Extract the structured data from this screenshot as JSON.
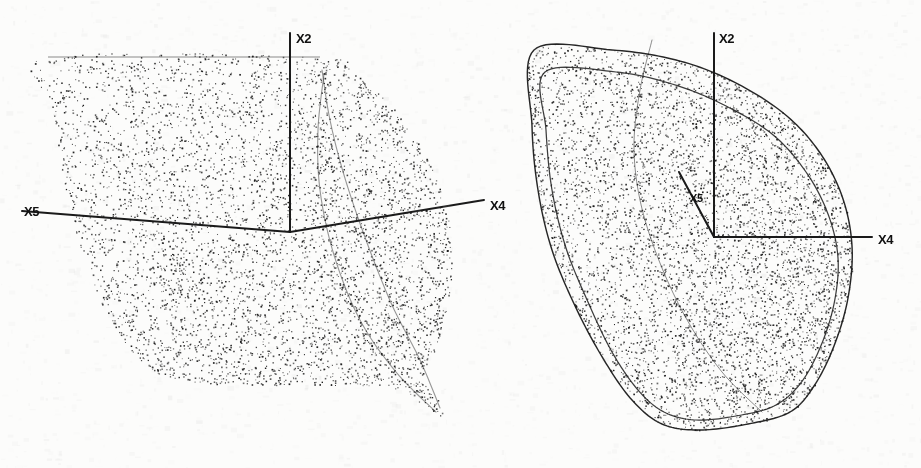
{
  "figure": {
    "kind": "scanned-scientific-figure",
    "background_color": "#fcfcfb",
    "ink_color": "#1a1a1a",
    "panel_count": 2
  },
  "chart_data": {
    "type": "scatter",
    "title": "",
    "subtitle": "",
    "xlabel": "",
    "ylabel": "",
    "grid": false,
    "legend": null,
    "panels": [
      {
        "name": "left-panel",
        "origin": [
          290,
          232
        ],
        "axes": [
          {
            "name": "X2",
            "label": "X2",
            "direction": "up",
            "from": [
              290,
              232
            ],
            "to": [
              290,
              33
            ],
            "label_position": [
              296,
              32
            ]
          },
          {
            "name": "X5",
            "label": "X5",
            "direction": "left",
            "from": [
              290,
              232
            ],
            "to": [
              22,
              211
            ],
            "label_position": [
              24,
              205
            ]
          },
          {
            "name": "X4",
            "label": "X4",
            "direction": "right",
            "from": [
              290,
              232
            ],
            "to": [
              484,
              200
            ],
            "label_position": [
              490,
              199
            ]
          }
        ],
        "cloud": {
          "point_count": 5200,
          "dot_size_px": 1.15,
          "shading": "uniform-stipple-with-dense-fold-ridge",
          "boundary": [
            [
              48,
              57
            ],
            [
              320,
              57
            ],
            [
              352,
              72
            ],
            [
              393,
              108
            ],
            [
              424,
              152
            ],
            [
              444,
              200
            ],
            [
              452,
              252
            ],
            [
              448,
              300
            ],
            [
              437,
              345
            ],
            [
              424,
              378
            ],
            [
              440,
              402
            ],
            [
              442,
              417
            ],
            [
              424,
              405
            ],
            [
              392,
              388
            ],
            [
              330,
              385
            ],
            [
              258,
              385
            ],
            [
              196,
              382
            ],
            [
              152,
              370
            ],
            [
              122,
              340
            ],
            [
              98,
              295
            ],
            [
              78,
              240
            ],
            [
              62,
              170
            ],
            [
              52,
              105
            ]
          ],
          "fold_ridges": [
            [
              [
                322,
                70
              ],
              [
                330,
                120
              ],
              [
                344,
                175
              ],
              [
                366,
                240
              ],
              [
                392,
                305
              ],
              [
                420,
                360
              ],
              [
                440,
                408
              ]
            ],
            [
              [
                324,
                74
              ],
              [
                318,
                130
              ],
              [
                320,
                190
              ],
              [
                334,
                255
              ],
              [
                360,
                320
              ],
              [
                396,
                372
              ],
              [
                436,
                412
              ]
            ]
          ]
        }
      },
      {
        "name": "right-panel",
        "origin": [
          714,
          237
        ],
        "axes": [
          {
            "name": "X2",
            "label": "X2",
            "direction": "up",
            "from": [
              714,
              237
            ],
            "to": [
              714,
              33
            ],
            "label_position": [
              719,
              32
            ]
          },
          {
            "name": "X4",
            "label": "X4",
            "direction": "right",
            "from": [
              714,
              237
            ],
            "to": [
              872,
              237
            ],
            "label_position": [
              878,
              233
            ]
          },
          {
            "name": "X5",
            "label": "X5",
            "direction": "upper-left",
            "from": [
              714,
              237
            ],
            "to": [
              679,
              172
            ],
            "label_position": [
              690,
              193
            ]
          }
        ],
        "cloud": {
          "point_count": 5600,
          "dot_size_px": 1.15,
          "shading": "uniform-stipple-dense-toward-right-edge",
          "outer_boundary": [
            [
              534,
              50
            ],
            [
              612,
              50
            ],
            [
              676,
              60
            ],
            [
              730,
              80
            ],
            [
              782,
              112
            ],
            [
              818,
              150
            ],
            [
              842,
              196
            ],
            [
              852,
              246
            ],
            [
              848,
              298
            ],
            [
              834,
              346
            ],
            [
              814,
              386
            ],
            [
              790,
              412
            ],
            [
              748,
              424
            ],
            [
              700,
              430
            ],
            [
              662,
              424
            ],
            [
              632,
              400
            ],
            [
              604,
              360
            ],
            [
              576,
              308
            ],
            [
              552,
              250
            ],
            [
              538,
              190
            ],
            [
              532,
              126
            ]
          ],
          "inner_boundary": [
            [
              545,
              72
            ],
            [
              616,
              72
            ],
            [
              672,
              84
            ],
            [
              722,
              104
            ],
            [
              772,
              134
            ],
            [
              806,
              172
            ],
            [
              828,
              214
            ],
            [
              838,
              258
            ],
            [
              834,
              304
            ],
            [
              820,
              348
            ],
            [
              800,
              384
            ],
            [
              774,
              406
            ],
            [
              736,
              416
            ],
            [
              696,
              420
            ],
            [
              664,
              412
            ],
            [
              638,
              390
            ],
            [
              612,
              352
            ],
            [
              588,
              302
            ],
            [
              566,
              248
            ],
            [
              552,
              190
            ],
            [
              546,
              130
            ]
          ],
          "fold_ridges": [
            [
              [
                652,
                40
              ],
              [
                640,
                90
              ],
              [
                634,
                145
              ],
              [
                640,
                200
              ],
              [
                658,
                258
              ],
              [
                686,
                318
              ],
              [
                722,
                372
              ],
              [
                762,
                412
              ]
            ]
          ]
        }
      }
    ]
  },
  "labels": {
    "left_x2": "X2",
    "left_x5": "X5",
    "left_x4": "X4",
    "right_x2": "X2",
    "right_x4": "X4",
    "right_x5": "X5"
  }
}
